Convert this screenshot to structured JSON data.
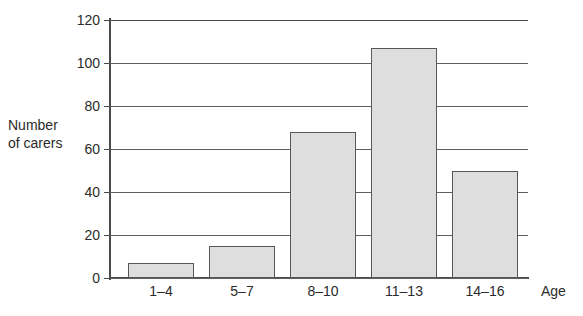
{
  "chart_data": {
    "type": "bar",
    "title": "",
    "subtitle": "",
    "categories": [
      "1–4",
      "5–7",
      "8–10",
      "11–13",
      "14–16"
    ],
    "values": [
      7,
      15,
      68,
      107,
      50
    ],
    "xlabel": "Age",
    "ylabel_line1": "Number",
    "ylabel_line2": "of carers",
    "ylabel": "Number of carers",
    "ylim": [
      0,
      120
    ],
    "ytick_labels": [
      "0",
      "20",
      "40",
      "60",
      "80",
      "100",
      "120"
    ],
    "ytick_values": [
      0,
      20,
      40,
      60,
      80,
      100,
      120
    ],
    "grid": "horizontal",
    "legend": "none",
    "colors": {
      "bar_fill": "#dedede",
      "bar_border": "#575757",
      "axis": "#4a4a4a",
      "gridline": "#5e5e5e",
      "text": "#2b2b2b",
      "background": "#ffffff"
    }
  }
}
